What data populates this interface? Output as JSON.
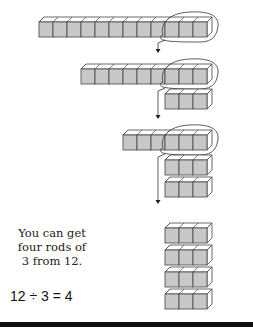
{
  "figure": {
    "caption": "You can get four rods of 3 from 12.",
    "caption_lines": [
      "You can get",
      "four rods of",
      "3 from 12."
    ],
    "equation": "12 ÷ 3 = 4",
    "cube_fill": "#c8c8c8",
    "cube_stroke": "#444444",
    "steps": [
      {
        "name": "rod-of-12",
        "cubes": 12,
        "circled_cubes": 3
      },
      {
        "name": "rod-of-9",
        "cubes": 9,
        "circled_cubes": 3,
        "removed_rods": 1
      },
      {
        "name": "rod-of-6",
        "cubes": 6,
        "circled_cubes": 3,
        "removed_rods": 2
      },
      {
        "name": "result",
        "rods_of_3": 4
      }
    ]
  }
}
